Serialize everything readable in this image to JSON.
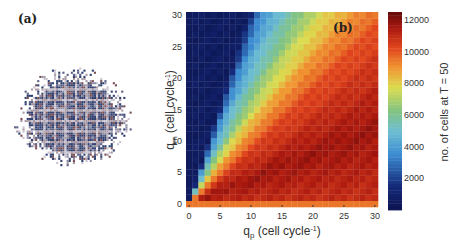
{
  "panel_a": {
    "label": "(a)",
    "description": "cell colony lattice snapshot"
  },
  "panel_b": {
    "label": "(b)"
  },
  "chart_data": {
    "type": "heatmap",
    "title": "",
    "xlabel": "q_p (cell cycle^-1)",
    "xlabel_main": "q",
    "xlabel_sub": "p",
    "xlabel_rest": " (cell cycle",
    "xlabel_sup": "-1",
    "xlabel_end": ")",
    "ylabel": "q_m (cell cycle^-1)",
    "ylabel_main": "q",
    "ylabel_sub": "m",
    "ylabel_rest": " (cell cycle",
    "ylabel_sup": "-1",
    "ylabel_end": ")",
    "x": [
      0,
      1,
      2,
      3,
      4,
      5,
      6,
      7,
      8,
      9,
      10,
      11,
      12,
      13,
      14,
      15,
      16,
      17,
      18,
      19,
      20,
      21,
      22,
      23,
      24,
      25,
      26,
      27,
      28,
      29,
      30
    ],
    "y": [
      0,
      1,
      2,
      3,
      4,
      5,
      6,
      7,
      8,
      9,
      10,
      11,
      12,
      13,
      14,
      15,
      16,
      17,
      18,
      19,
      20,
      21,
      22,
      23,
      24,
      25,
      26,
      27,
      28,
      29,
      30
    ],
    "xlim": [
      0,
      30
    ],
    "ylim": [
      0,
      30
    ],
    "xticks": [
      0,
      5,
      10,
      15,
      20,
      25,
      30
    ],
    "yticks": [
      0,
      5,
      10,
      15,
      20,
      25,
      30
    ],
    "colorbar": {
      "label": "no. of cells at T = 50",
      "ticks": [
        2000,
        4000,
        6000,
        8000,
        10000,
        12000
      ],
      "range": [
        0,
        12500
      ],
      "colormap": "jet-like (dark blue → cyan → green → yellow → red → dark red)"
    },
    "value_model": "value at (qp, qm) depends on ratio qm/qp; qm=0 row ≈ 9500; qp=0 column ≈ 500",
    "row0_value": 9500,
    "col0_value": 500
  }
}
